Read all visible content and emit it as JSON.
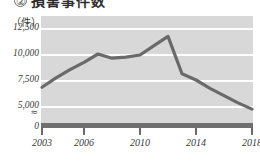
{
  "title": {
    "marker": "②",
    "text": "損害事件数"
  },
  "chart_data": {
    "type": "line",
    "title": "損害事件数",
    "xlabel": "",
    "ylabel": "",
    "unit_label": "（件）",
    "grid": true,
    "legend": null,
    "axis_break": "≈",
    "xlim": [
      2003,
      2018
    ],
    "ylim": [
      5000,
      12500
    ],
    "y_axis_zero_shown": true,
    "y_ticks": [
      "12,500",
      "10,000",
      "7,500",
      "5,000",
      "0"
    ],
    "y_tick_values": [
      12500,
      10000,
      7500,
      5000,
      0
    ],
    "x_ticks": [
      "2003",
      "2006",
      "2010",
      "2014",
      "2018"
    ],
    "x_tick_values": [
      2003,
      2006,
      2010,
      2014,
      2018
    ],
    "x": [
      2003,
      2004,
      2005,
      2006,
      2007,
      2008,
      2009,
      2010,
      2011,
      2012,
      2013,
      2014,
      2015,
      2016,
      2017,
      2018
    ],
    "values": [
      6800,
      7700,
      8500,
      9200,
      10000,
      9600,
      9700,
      9900,
      10800,
      11700,
      8100,
      7500,
      6700,
      6000,
      5300,
      4700
    ],
    "series": [
      {
        "name": "損害事件数",
        "values": [
          6800,
          7700,
          8500,
          9200,
          10000,
          9600,
          9700,
          9900,
          10800,
          11700,
          8100,
          7500,
          6700,
          6000,
          5300,
          4700
        ]
      }
    ]
  },
  "colors": {
    "plot_background": "#d8d8d8",
    "gridline": "#ffffff",
    "line": "#6a6a6a",
    "baseline_band": "#6f6f6f",
    "text": "#3a3a3a"
  }
}
